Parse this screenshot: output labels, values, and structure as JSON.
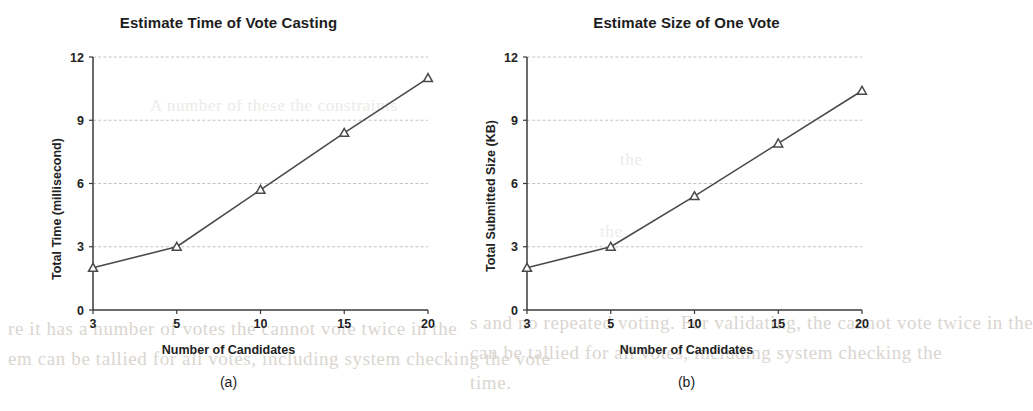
{
  "page": {
    "background_color": "#ffffff",
    "ink_color": "#3a3a3a",
    "grid_color": "#b9bcc4",
    "bleed_color": "#d9d4ce"
  },
  "figures": [
    {
      "key": "a",
      "title": "Estimate Time of Vote Casting",
      "subcaption": "(a)",
      "xlabel": "Number of Candidates",
      "ylabel": "Total Time (millisecond)"
    },
    {
      "key": "b",
      "title": "Estimate Size of One Vote",
      "subcaption": "(b)",
      "xlabel": "Number of Candidates",
      "ylabel": "Total Submitted Size (KB)"
    }
  ],
  "bleed_text": {
    "line1": "re it has a number of votes the cannot vote twice in the",
    "line2": "em can be tallied for all votes, including system checking the vote",
    "line3": "s and no repeated voting. For validating, the cannot vote twice in the",
    "line4": "can be tallied for all votes, including system checking the",
    "line5": "time.",
    "line6": "A number of these the constraints",
    "line7": "the",
    "line8": "the"
  },
  "chart_data": [
    {
      "type": "line",
      "title": "Estimate Time of Vote Casting",
      "subcaption": "(a)",
      "xlabel": "Number of Candidates",
      "ylabel": "Total Time (millisecond)",
      "categories": [
        "3",
        "5",
        "10",
        "15",
        "20"
      ],
      "values": [
        2.0,
        3.0,
        5.7,
        8.4,
        11.0
      ],
      "xticklabels": [
        "3",
        "5",
        "10",
        "15",
        "20"
      ],
      "yticklabels": [
        "0",
        "3",
        "6",
        "9",
        "12"
      ],
      "yticks": [
        0,
        3,
        6,
        9,
        12
      ],
      "ylim": [
        0,
        12
      ],
      "grid": "horizontal",
      "legend": "none",
      "marker": "triangle-open",
      "line_color": "#4a4a4a"
    },
    {
      "type": "line",
      "title": "Estimate Size of One Vote",
      "subcaption": "(b)",
      "xlabel": "Number of Candidates",
      "ylabel": "Total Submitted Size (KB)",
      "categories": [
        "3",
        "5",
        "10",
        "15",
        "20"
      ],
      "values": [
        2.0,
        3.0,
        5.4,
        7.9,
        10.4
      ],
      "xticklabels": [
        "3",
        "5",
        "10",
        "15",
        "20"
      ],
      "yticklabels": [
        "0",
        "3",
        "6",
        "9",
        "12"
      ],
      "yticks": [
        0,
        3,
        6,
        9,
        12
      ],
      "ylim": [
        0,
        12
      ],
      "grid": "horizontal",
      "legend": "none",
      "marker": "triangle-open",
      "line_color": "#4a4a4a"
    }
  ]
}
